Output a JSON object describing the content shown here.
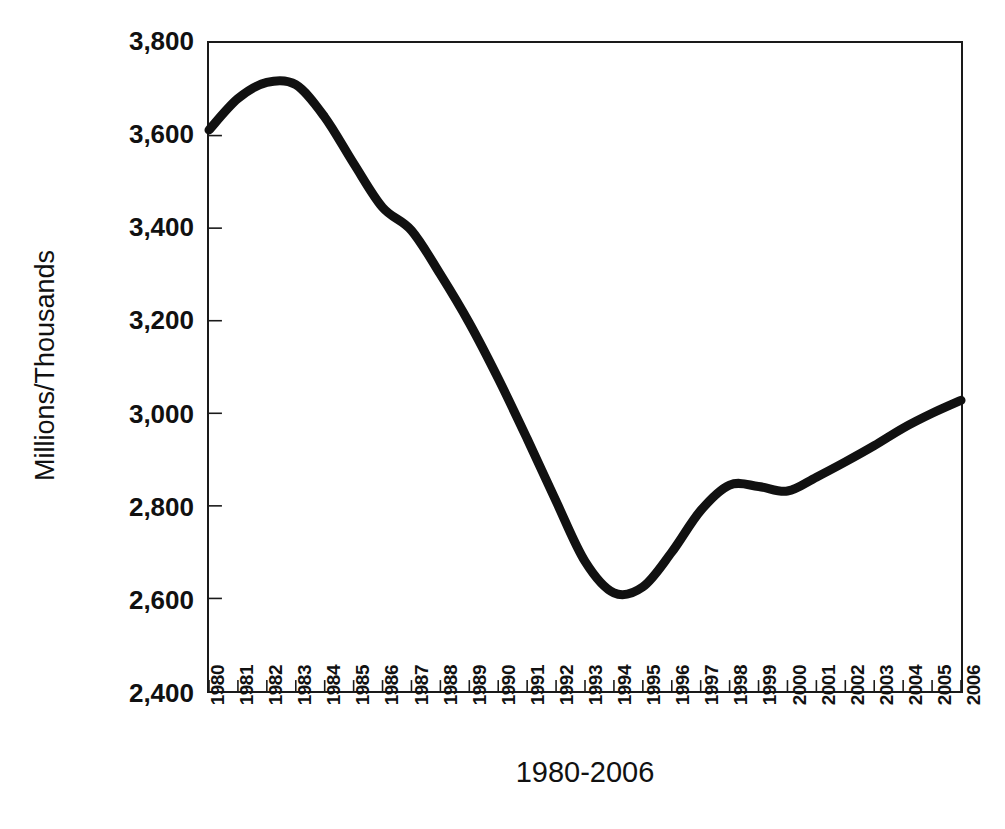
{
  "chart_data": {
    "type": "line",
    "title": "",
    "subtitle": "",
    "xlabel": "1980-2006",
    "ylabel": "Millions/Thousands",
    "xlim": [
      1980,
      2006
    ],
    "ylim": [
      2400,
      3800
    ],
    "yticks": [
      3800,
      3600,
      3400,
      3200,
      3000,
      2800,
      2600,
      2400
    ],
    "ytick_labels": [
      "3,800",
      "3,600",
      "3,400",
      "3,200",
      "3,000",
      "2,800",
      "2,600",
      "2,400"
    ],
    "xticks": [
      1980,
      1981,
      1982,
      1983,
      1984,
      1985,
      1986,
      1987,
      1988,
      1989,
      1990,
      1991,
      1992,
      1993,
      1994,
      1995,
      1996,
      1997,
      1998,
      1999,
      2000,
      2001,
      2002,
      2003,
      2004,
      2005,
      2006
    ],
    "xtick_labels": [
      "1980",
      "1981",
      "1982",
      "1983",
      "1984",
      "1985",
      "1986",
      "1987",
      "1988",
      "1989",
      "1990",
      "1991",
      "1992",
      "1993",
      "1994",
      "1995",
      "1996",
      "1997",
      "1998",
      "1999",
      "2000",
      "2001",
      "2002",
      "2003",
      "2004",
      "2005",
      "2006"
    ],
    "grid": false,
    "legend": null,
    "line_color": "#111111",
    "line_width": 9,
    "categories": [
      "1980",
      "1981",
      "1982",
      "1983",
      "1984",
      "1985",
      "1986",
      "1987",
      "1988",
      "1989",
      "1990",
      "1991",
      "1992",
      "1993",
      "1994",
      "1995",
      "1996",
      "1997",
      "1998",
      "1999",
      "2000",
      "2001",
      "2002",
      "2003",
      "2004",
      "2005",
      "2006"
    ],
    "values": [
      3612,
      3680,
      3715,
      3710,
      3640,
      3540,
      3445,
      3395,
      3300,
      3195,
      3075,
      2945,
      2810,
      2680,
      2612,
      2625,
      2700,
      2790,
      2845,
      2842,
      2832,
      2862,
      2895,
      2930,
      2968,
      3000,
      3028
    ],
    "series": [
      {
        "name": "Millions/Thousands",
        "values": [
          3612,
          3680,
          3715,
          3710,
          3640,
          3540,
          3445,
          3395,
          3300,
          3195,
          3075,
          2945,
          2810,
          2680,
          2612,
          2625,
          2700,
          2790,
          2845,
          2842,
          2832,
          2862,
          2895,
          2930,
          2968,
          3000,
          3028
        ]
      }
    ],
    "annotations": {
      "peak": {
        "x": "1982",
        "y": 3715
      },
      "trough": {
        "x": "1994",
        "y": 2612
      },
      "end": {
        "x": "2006",
        "y": 3028
      }
    }
  },
  "artifacts": {
    "top_cut_text": "",
    "bottom_cut_text": ""
  }
}
